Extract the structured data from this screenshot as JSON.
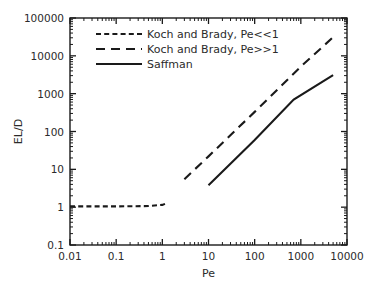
{
  "chart_data": {
    "type": "line",
    "title": "",
    "xlabel": "Pe",
    "ylabel": "EL/D",
    "xscale": "log",
    "yscale": "log",
    "xlim": [
      0.01,
      10000
    ],
    "ylim": [
      0.1,
      100000
    ],
    "grid": false,
    "legend_position": "upper-left-inside",
    "xticks": [
      "0.01",
      "0.1",
      "1",
      "10",
      "100",
      "1000",
      "10000"
    ],
    "xtick_values": [
      0.01,
      0.1,
      1,
      10,
      100,
      1000,
      10000
    ],
    "yticks": [
      "0.1",
      "1",
      "10",
      "100",
      "1000",
      "10000",
      "100000"
    ],
    "ytick_values": [
      0.1,
      1,
      10,
      100,
      1000,
      10000,
      100000
    ],
    "minor_ticks": true,
    "series": [
      {
        "name": "Koch and Brady, Pe<<1",
        "style": "short-dashed",
        "color": "#1a1a1a",
        "x": [
          0.01,
          0.1,
          0.5,
          1.0,
          1.3
        ],
        "y": [
          1.05,
          1.05,
          1.07,
          1.15,
          1.3
        ]
      },
      {
        "name": "Koch and Brady, Pe>>1",
        "style": "long-dashed",
        "color": "#1a1a1a",
        "x": [
          3.0,
          10,
          100,
          1000,
          5000
        ],
        "y": [
          5.5,
          22,
          330,
          5200,
          31000
        ]
      },
      {
        "name": "Saffman",
        "style": "solid",
        "color": "#1a1a1a",
        "x": [
          10,
          100,
          700,
          5000
        ],
        "y": [
          3.8,
          60,
          700,
          3100
        ]
      }
    ]
  },
  "legend": {
    "items": [
      {
        "label": "Koch  and  Brady,  Pe<<1",
        "style": "short-dashed"
      },
      {
        "label": "Koch  and  Brady,  Pe>>1",
        "style": "long-dashed"
      },
      {
        "label": "Saffman",
        "style": "solid"
      }
    ]
  },
  "axes": {
    "x_title": "Pe",
    "y_title": "EL/D"
  },
  "caption": ""
}
